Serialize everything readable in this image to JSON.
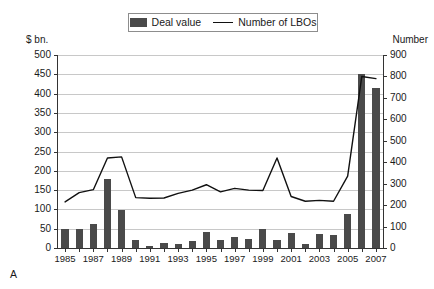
{
  "figure": {
    "letter": "A",
    "faint_top_text": "",
    "background": "#ffffff",
    "bar_color": "#4a4a4a",
    "line_color": "#111111",
    "grid_color": "#c8c8c8",
    "axis_color": "#333333"
  },
  "legend": {
    "items": [
      {
        "label": "Deal value",
        "marker": "bar-swatch"
      },
      {
        "label": "Number of LBOs",
        "marker": "line-swatch"
      }
    ]
  },
  "axes": {
    "left_caption": "$ bn.",
    "right_caption": "Number",
    "left_ticks": [
      "0",
      "50",
      "100",
      "150",
      "200",
      "250",
      "300",
      "350",
      "400",
      "450",
      "500"
    ],
    "right_ticks": [
      "0",
      "100",
      "200",
      "300",
      "400",
      "500",
      "600",
      "700",
      "800",
      "900"
    ],
    "x_ticks": [
      "1985",
      "1987",
      "1989",
      "1991",
      "1993",
      "1995",
      "1997",
      "1999",
      "2001",
      "2003",
      "2005",
      "2007"
    ]
  },
  "chart_data": {
    "type": "bar",
    "title": "",
    "subtitle": "",
    "xlabel": "",
    "ylabel": "$ bn.",
    "y2label": "Number",
    "ylim": [
      0,
      500
    ],
    "y2lim": [
      0,
      900
    ],
    "grid": true,
    "legend_position": "top-center",
    "categories": [
      "1985",
      "1986",
      "1987",
      "1988",
      "1989",
      "1990",
      "1991",
      "1992",
      "1993",
      "1994",
      "1995",
      "1996",
      "1997",
      "1998",
      "1999",
      "2000",
      "2001",
      "2002",
      "2003",
      "2004",
      "2005",
      "2006",
      "2007"
    ],
    "series": [
      {
        "name": "Deal value",
        "type": "bar",
        "axis": "left",
        "unit": "$ bn.",
        "values": [
          50,
          48,
          63,
          180,
          98,
          22,
          6,
          14,
          10,
          17,
          42,
          20,
          28,
          24,
          50,
          20,
          38,
          10,
          37,
          35,
          88,
          450,
          415
        ]
      },
      {
        "name": "Number of LBOs",
        "type": "line",
        "axis": "right",
        "unit": "count",
        "values": [
          215,
          258,
          272,
          420,
          425,
          235,
          232,
          233,
          255,
          270,
          295,
          262,
          278,
          270,
          268,
          420,
          240,
          218,
          222,
          218,
          335,
          800,
          790
        ]
      }
    ]
  }
}
